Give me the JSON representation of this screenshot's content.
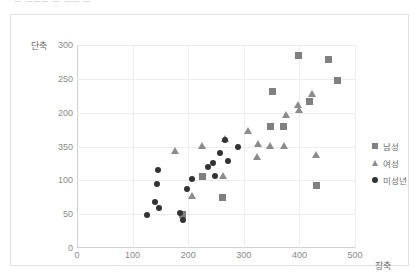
{
  "top_clipped_text": "ㅡ  ㅡㅡㅡ  ㅡ  ㅡㅡ  ㅡ",
  "axis_titles": {
    "y": "단축",
    "x": "장축"
  },
  "legend": {
    "position": "right",
    "items": [
      {
        "label": "남성",
        "marker": "square-marker-icon",
        "color": "#808080"
      },
      {
        "label": "여성",
        "marker": "triangle-marker-icon",
        "color": "#8c8c8c"
      },
      {
        "label": "미성년",
        "marker": "circle-marker-icon",
        "color": "#333333"
      }
    ]
  },
  "chart_data": {
    "type": "scatter",
    "title": "",
    "subtitle": "",
    "xlabel": "장축",
    "ylabel": "단축",
    "xlim": [
      0,
      500
    ],
    "ylim": [
      0,
      300
    ],
    "xticks": [
      "0",
      "100",
      "200",
      "300",
      "400",
      "500"
    ],
    "xtick_values": [
      0,
      100,
      200,
      300,
      400,
      500
    ],
    "yticks": [
      "0",
      "50",
      "100",
      "350",
      "200",
      "250",
      "300"
    ],
    "ytick_values": [
      0,
      50,
      100,
      150,
      200,
      250,
      300
    ],
    "ytick_note": "label at the 150 gridline is rendered as '350' in the source image",
    "grid": true,
    "legend_position": "right",
    "series": [
      {
        "name": "남성",
        "marker": "square",
        "color": "#808080",
        "points": [
          [
            190,
            49
          ],
          [
            226,
            106
          ],
          [
            262,
            74
          ],
          [
            348,
            179
          ],
          [
            352,
            231
          ],
          [
            372,
            179
          ],
          [
            398,
            284
          ],
          [
            418,
            216
          ],
          [
            430,
            93
          ],
          [
            452,
            278
          ],
          [
            468,
            248
          ]
        ]
      },
      {
        "name": "여성",
        "marker": "triangle",
        "color": "#8c8c8c",
        "points": [
          [
            176,
            144
          ],
          [
            206,
            78
          ],
          [
            224,
            151
          ],
          [
            262,
            107
          ],
          [
            266,
            162
          ],
          [
            308,
            173
          ],
          [
            324,
            135
          ],
          [
            326,
            154
          ],
          [
            348,
            152
          ],
          [
            372,
            152
          ],
          [
            376,
            198
          ],
          [
            398,
            212
          ],
          [
            400,
            204
          ],
          [
            422,
            228
          ],
          [
            430,
            138
          ]
        ]
      },
      {
        "name": "미성년",
        "marker": "circle",
        "color": "#333333",
        "points": [
          [
            126,
            49
          ],
          [
            140,
            68
          ],
          [
            148,
            59
          ],
          [
            146,
            115
          ],
          [
            144,
            95
          ],
          [
            186,
            52
          ],
          [
            190,
            42
          ],
          [
            198,
            87
          ],
          [
            206,
            102
          ],
          [
            236,
            120
          ],
          [
            244,
            126
          ],
          [
            248,
            106
          ],
          [
            258,
            140
          ],
          [
            266,
            160
          ],
          [
            272,
            129
          ],
          [
            290,
            149
          ]
        ]
      }
    ]
  }
}
